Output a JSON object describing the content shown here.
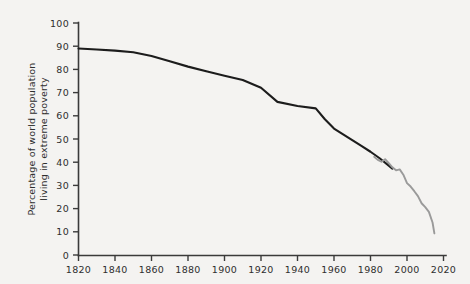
{
  "chart_data": {
    "type": "line",
    "title": "",
    "subtitle": "",
    "xlabel": "",
    "ylabel": "Percentage of world population living in extreme poverty",
    "ylabel_line1": "Percentage of world population",
    "ylabel_line2": "living in extreme poverty",
    "xlim": [
      1820,
      2020
    ],
    "ylim": [
      0,
      100
    ],
    "grid": false,
    "legend": "none",
    "x_ticks": [
      1820,
      1840,
      1860,
      1880,
      1900,
      1920,
      1940,
      1960,
      1980,
      2000,
      2020
    ],
    "x_tick_labels": [
      "1820",
      "1840",
      "1860",
      "1880",
      "1900",
      "1920",
      "1940",
      "1960",
      "1980",
      "2000",
      "2020"
    ],
    "y_ticks": [
      0,
      10,
      20,
      30,
      40,
      50,
      60,
      70,
      80,
      90,
      100
    ],
    "y_tick_labels": [
      "0",
      "10",
      "20",
      "30",
      "40",
      "50",
      "60",
      "70",
      "80",
      "90",
      "100"
    ],
    "series": [
      {
        "name": "historical-estimate",
        "color": "#1c1c1c",
        "x": [
          1820,
          1830,
          1840,
          1850,
          1860,
          1870,
          1880,
          1890,
          1900,
          1910,
          1920,
          1929,
          1940,
          1950,
          1955,
          1960,
          1965,
          1970,
          1975,
          1980,
          1985,
          1990,
          1992
        ],
        "values": [
          89.0,
          88.6,
          88.1,
          87.4,
          85.8,
          83.5,
          81.2,
          79.2,
          77.3,
          75.4,
          72.1,
          66.0,
          64.2,
          63.2,
          58.5,
          54.5,
          52.0,
          49.5,
          47.0,
          44.5,
          41.7,
          38.5,
          37.2
        ]
      },
      {
        "name": "recent-measured",
        "color": "#9a9a9a",
        "x": [
          1982,
          1984,
          1986,
          1988,
          1990,
          1992,
          1994,
          1996,
          1998,
          2000,
          2002,
          2004,
          2006,
          2008,
          2010,
          2012,
          2014,
          2015
        ],
        "values": [
          42.3,
          41.0,
          40.2,
          41.3,
          39.6,
          37.8,
          36.5,
          36.9,
          34.6,
          31.0,
          29.5,
          27.5,
          25.4,
          22.3,
          20.6,
          18.6,
          14.0,
          9.3
        ]
      }
    ]
  },
  "colors": {
    "background": "#f4f3f1",
    "axis": "#3a3a3a",
    "text": "#2e2e2e",
    "series_main": "#1c1c1c",
    "series_secondary": "#9a9a9a"
  }
}
